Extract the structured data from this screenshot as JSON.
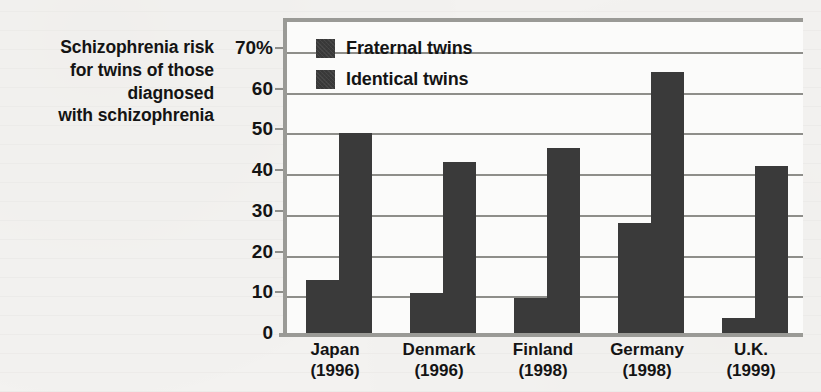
{
  "caption": {
    "lines": [
      "Schizophrenia risk",
      "for twins of those",
      "diagnosed",
      "with schizophrenia"
    ]
  },
  "legend": {
    "items": [
      {
        "label": "Fraternal twins",
        "color": "#3a3a3a"
      },
      {
        "label": "Identical twins",
        "color": "#3a3a3a"
      }
    ]
  },
  "axis": {
    "y_ticks": [
      "0",
      "10",
      "20",
      "30",
      "40",
      "50",
      "60",
      "70%"
    ],
    "y_values": [
      0,
      10,
      20,
      30,
      40,
      50,
      60,
      70
    ]
  },
  "chart_data": {
    "type": "bar",
    "title": "Schizophrenia risk for twins of those diagnosed with schizophrenia",
    "xlabel": "",
    "ylabel": "",
    "ylim": [
      0,
      70
    ],
    "ytick_labels": [
      "0",
      "10",
      "20",
      "30",
      "40",
      "50",
      "60",
      "70%"
    ],
    "grid": true,
    "legend_position": "top-left inside plot",
    "categories": [
      "Japan",
      "Denmark",
      "Finland",
      "Germany",
      "U.K."
    ],
    "category_years": [
      "(1996)",
      "(1996)",
      "(1998)",
      "(1998)",
      "(1999)"
    ],
    "category_labels": [
      [
        "Japan",
        "(1996)"
      ],
      [
        "Denmark",
        "(1996)"
      ],
      [
        "Finland",
        "(1998)"
      ],
      [
        "Germany",
        "(1998)"
      ],
      [
        "U.K.",
        "(1999)"
      ]
    ],
    "series": [
      {
        "name": "Fraternal twins",
        "color": "#3a3a3a",
        "values": [
          14,
          10.8,
          9.5,
          28,
          4.7
        ]
      },
      {
        "name": "Identical twins",
        "color": "#3a3a3a",
        "values": [
          50,
          43,
          46.5,
          65,
          42
        ]
      }
    ]
  },
  "colors": {
    "bar": "#3a3a3a",
    "background": "#f3f2f0",
    "plot_background": "#fbfbfa",
    "grid": "#8e8e8a",
    "axis": "#9a9a96",
    "text": "#141414"
  }
}
